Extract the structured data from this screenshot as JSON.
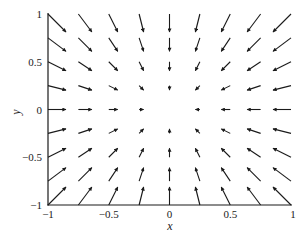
{
  "chart_data": {
    "type": "quiver",
    "title": "",
    "xlabel": "x",
    "ylabel": "y",
    "xlim": [
      -1,
      1
    ],
    "ylim": [
      -1,
      1
    ],
    "xticks": [
      -1,
      -0.5,
      0,
      0.5,
      1
    ],
    "xtick_labels": [
      "−1",
      "−0.5",
      "0",
      "0.5",
      "1"
    ],
    "yticks": [
      -1,
      -0.5,
      0,
      0.5,
      1
    ],
    "ytick_labels": [
      "−1",
      "−0.5",
      "0",
      "0.5",
      "1"
    ],
    "grid": false,
    "legend": null,
    "field": "(u, v) = (−x, −y)",
    "grid_points": [
      -1,
      -0.75,
      -0.5,
      -0.25,
      0,
      0.25,
      0.5,
      0.75,
      1
    ],
    "arrow_scale_px_per_unit": 18,
    "arrow_color": "#1a1a1a",
    "vectors": [
      {
        "x": -1,
        "y": 1,
        "u": 1,
        "v": -1
      },
      {
        "x": -0.75,
        "y": 1,
        "u": 0.75,
        "v": -1
      },
      {
        "x": -0.5,
        "y": 1,
        "u": 0.5,
        "v": -1
      },
      {
        "x": -0.25,
        "y": 1,
        "u": 0.25,
        "v": -1
      },
      {
        "x": 0,
        "y": 1,
        "u": 0,
        "v": -1
      },
      {
        "x": 0.25,
        "y": 1,
        "u": -0.25,
        "v": -1
      },
      {
        "x": 0.5,
        "y": 1,
        "u": -0.5,
        "v": -1
      },
      {
        "x": 0.75,
        "y": 1,
        "u": -0.75,
        "v": -1
      },
      {
        "x": 1,
        "y": 1,
        "u": -1,
        "v": -1
      },
      {
        "x": -1,
        "y": 0.75,
        "u": 1,
        "v": -0.75
      },
      {
        "x": -0.75,
        "y": 0.75,
        "u": 0.75,
        "v": -0.75
      },
      {
        "x": -0.5,
        "y": 0.75,
        "u": 0.5,
        "v": -0.75
      },
      {
        "x": -0.25,
        "y": 0.75,
        "u": 0.25,
        "v": -0.75
      },
      {
        "x": 0,
        "y": 0.75,
        "u": 0,
        "v": -0.75
      },
      {
        "x": 0.25,
        "y": 0.75,
        "u": -0.25,
        "v": -0.75
      },
      {
        "x": 0.5,
        "y": 0.75,
        "u": -0.5,
        "v": -0.75
      },
      {
        "x": 0.75,
        "y": 0.75,
        "u": -0.75,
        "v": -0.75
      },
      {
        "x": 1,
        "y": 0.75,
        "u": -1,
        "v": -0.75
      },
      {
        "x": -1,
        "y": 0.5,
        "u": 1,
        "v": -0.5
      },
      {
        "x": -0.75,
        "y": 0.5,
        "u": 0.75,
        "v": -0.5
      },
      {
        "x": -0.5,
        "y": 0.5,
        "u": 0.5,
        "v": -0.5
      },
      {
        "x": -0.25,
        "y": 0.5,
        "u": 0.25,
        "v": -0.5
      },
      {
        "x": 0,
        "y": 0.5,
        "u": 0,
        "v": -0.5
      },
      {
        "x": 0.25,
        "y": 0.5,
        "u": -0.25,
        "v": -0.5
      },
      {
        "x": 0.5,
        "y": 0.5,
        "u": -0.5,
        "v": -0.5
      },
      {
        "x": 0.75,
        "y": 0.5,
        "u": -0.75,
        "v": -0.5
      },
      {
        "x": 1,
        "y": 0.5,
        "u": -1,
        "v": -0.5
      },
      {
        "x": -1,
        "y": 0.25,
        "u": 1,
        "v": -0.25
      },
      {
        "x": -0.75,
        "y": 0.25,
        "u": 0.75,
        "v": -0.25
      },
      {
        "x": -0.5,
        "y": 0.25,
        "u": 0.5,
        "v": -0.25
      },
      {
        "x": -0.25,
        "y": 0.25,
        "u": 0.25,
        "v": -0.25
      },
      {
        "x": 0,
        "y": 0.25,
        "u": 0,
        "v": -0.25
      },
      {
        "x": 0.25,
        "y": 0.25,
        "u": -0.25,
        "v": -0.25
      },
      {
        "x": 0.5,
        "y": 0.25,
        "u": -0.5,
        "v": -0.25
      },
      {
        "x": 0.75,
        "y": 0.25,
        "u": -0.75,
        "v": -0.25
      },
      {
        "x": 1,
        "y": 0.25,
        "u": -1,
        "v": -0.25
      },
      {
        "x": -1,
        "y": 0,
        "u": 1,
        "v": 0
      },
      {
        "x": -0.75,
        "y": 0,
        "u": 0.75,
        "v": 0
      },
      {
        "x": -0.5,
        "y": 0,
        "u": 0.5,
        "v": 0
      },
      {
        "x": -0.25,
        "y": 0,
        "u": 0.25,
        "v": 0
      },
      {
        "x": 0.25,
        "y": 0,
        "u": -0.25,
        "v": 0
      },
      {
        "x": 0.5,
        "y": 0,
        "u": -0.5,
        "v": 0
      },
      {
        "x": 0.75,
        "y": 0,
        "u": -0.75,
        "v": 0
      },
      {
        "x": 1,
        "y": 0,
        "u": -1,
        "v": 0
      },
      {
        "x": -1,
        "y": -0.25,
        "u": 1,
        "v": 0.25
      },
      {
        "x": -0.75,
        "y": -0.25,
        "u": 0.75,
        "v": 0.25
      },
      {
        "x": -0.5,
        "y": -0.25,
        "u": 0.5,
        "v": 0.25
      },
      {
        "x": -0.25,
        "y": -0.25,
        "u": 0.25,
        "v": 0.25
      },
      {
        "x": 0,
        "y": -0.25,
        "u": 0,
        "v": 0.25
      },
      {
        "x": 0.25,
        "y": -0.25,
        "u": -0.25,
        "v": 0.25
      },
      {
        "x": 0.5,
        "y": -0.25,
        "u": -0.5,
        "v": 0.25
      },
      {
        "x": 0.75,
        "y": -0.25,
        "u": -0.75,
        "v": 0.25
      },
      {
        "x": 1,
        "y": -0.25,
        "u": -1,
        "v": 0.25
      },
      {
        "x": -1,
        "y": -0.5,
        "u": 1,
        "v": 0.5
      },
      {
        "x": -0.75,
        "y": -0.5,
        "u": 0.75,
        "v": 0.5
      },
      {
        "x": -0.5,
        "y": -0.5,
        "u": 0.5,
        "v": 0.5
      },
      {
        "x": -0.25,
        "y": -0.5,
        "u": 0.25,
        "v": 0.5
      },
      {
        "x": 0,
        "y": -0.5,
        "u": 0,
        "v": 0.5
      },
      {
        "x": 0.25,
        "y": -0.5,
        "u": -0.25,
        "v": 0.5
      },
      {
        "x": 0.5,
        "y": -0.5,
        "u": -0.5,
        "v": 0.5
      },
      {
        "x": 0.75,
        "y": -0.5,
        "u": -0.75,
        "v": 0.5
      },
      {
        "x": 1,
        "y": -0.5,
        "u": -1,
        "v": 0.5
      },
      {
        "x": -1,
        "y": -0.75,
        "u": 1,
        "v": 0.75
      },
      {
        "x": -0.75,
        "y": -0.75,
        "u": 0.75,
        "v": 0.75
      },
      {
        "x": -0.5,
        "y": -0.75,
        "u": 0.5,
        "v": 0.75
      },
      {
        "x": -0.25,
        "y": -0.75,
        "u": 0.25,
        "v": 0.75
      },
      {
        "x": 0,
        "y": -0.75,
        "u": 0,
        "v": 0.75
      },
      {
        "x": 0.25,
        "y": -0.75,
        "u": -0.25,
        "v": 0.75
      },
      {
        "x": 0.5,
        "y": -0.75,
        "u": -0.5,
        "v": 0.75
      },
      {
        "x": 0.75,
        "y": -0.75,
        "u": -0.75,
        "v": 0.75
      },
      {
        "x": 1,
        "y": -0.75,
        "u": -1,
        "v": 0.75
      },
      {
        "x": -1,
        "y": -1,
        "u": 1,
        "v": 1
      },
      {
        "x": -0.75,
        "y": -1,
        "u": 0.75,
        "v": 1
      },
      {
        "x": -0.5,
        "y": -1,
        "u": 0.5,
        "v": 1
      },
      {
        "x": -0.25,
        "y": -1,
        "u": 0.25,
        "v": 1
      },
      {
        "x": 0,
        "y": -1,
        "u": 0,
        "v": 1
      },
      {
        "x": 0.25,
        "y": -1,
        "u": -0.25,
        "v": 1
      },
      {
        "x": 0.5,
        "y": -1,
        "u": -0.5,
        "v": 1
      },
      {
        "x": 0.75,
        "y": -1,
        "u": -0.75,
        "v": 1
      },
      {
        "x": 1,
        "y": -1,
        "u": -1,
        "v": 1
      }
    ]
  }
}
